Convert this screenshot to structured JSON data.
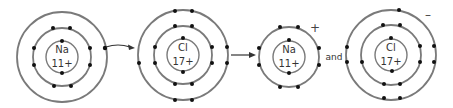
{
  "colors": {
    "shell": "#7a7a7a",
    "electron": "#111111",
    "text": "#333333",
    "background": "#ffffff"
  },
  "atoms": [
    {
      "id": "na-atom",
      "symbol": "Na",
      "nuclear_charge": "11+",
      "ion_charge": "",
      "shells": [
        2,
        8,
        1
      ]
    },
    {
      "id": "cl-atom",
      "symbol": "Cl",
      "nuclear_charge": "17+",
      "ion_charge": "",
      "shells": [
        2,
        8,
        7
      ]
    },
    {
      "id": "na-ion",
      "symbol": "Na",
      "nuclear_charge": "11+",
      "ion_charge": "+",
      "shells": [
        2,
        8
      ]
    },
    {
      "id": "cl-ion",
      "symbol": "Cl",
      "nuclear_charge": "17+",
      "ion_charge": "–",
      "shells": [
        2,
        8,
        8
      ]
    }
  ],
  "connector": "and",
  "arrows": [
    {
      "id": "transfer-arrow",
      "type": "curved",
      "meaning": "electron transfer"
    },
    {
      "id": "reaction-arrow",
      "type": "straight",
      "meaning": "yields"
    }
  ]
}
